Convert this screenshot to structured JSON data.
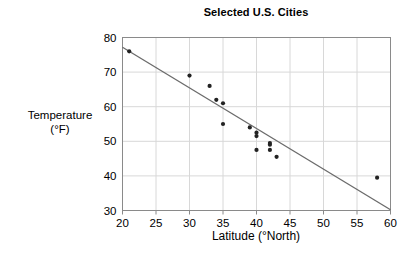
{
  "chart_data": {
    "type": "scatter",
    "title": "Selected U.S. Cities",
    "xlabel": "Latitude (°North)",
    "ylabel_line1": "Temperature",
    "ylabel_line2": "(°F)",
    "xlim": [
      20,
      60
    ],
    "ylim": [
      30,
      80
    ],
    "xticks": [
      20,
      25,
      30,
      35,
      40,
      45,
      50,
      55,
      60
    ],
    "yticks": [
      30,
      40,
      50,
      60,
      70,
      80
    ],
    "grid": true,
    "legend": null,
    "point_color": "#222222",
    "line_color": "#6b6b6b",
    "grid_color": "#d8d8d8",
    "frame_color": "#8a8a8a",
    "points": [
      {
        "x": 21.0,
        "y": 76.0
      },
      {
        "x": 30.0,
        "y": 69.0
      },
      {
        "x": 33.0,
        "y": 66.0
      },
      {
        "x": 34.0,
        "y": 62.0
      },
      {
        "x": 35.0,
        "y": 61.0
      },
      {
        "x": 35.0,
        "y": 55.0
      },
      {
        "x": 39.0,
        "y": 54.0
      },
      {
        "x": 40.0,
        "y": 52.5
      },
      {
        "x": 40.0,
        "y": 51.5
      },
      {
        "x": 40.0,
        "y": 47.5
      },
      {
        "x": 42.0,
        "y": 49.5
      },
      {
        "x": 42.0,
        "y": 49.0
      },
      {
        "x": 42.0,
        "y": 47.5
      },
      {
        "x": 43.0,
        "y": 45.5
      },
      {
        "x": 58.0,
        "y": 39.5
      }
    ],
    "trend_line": {
      "x1": 20.0,
      "y1": 77.2,
      "x2": 60.0,
      "y2": 30.2
    }
  }
}
